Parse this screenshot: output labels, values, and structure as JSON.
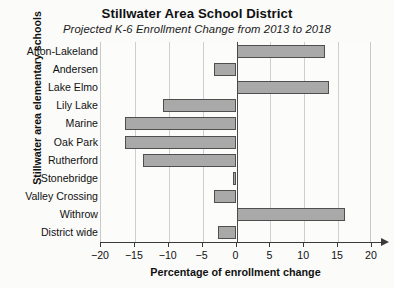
{
  "chart_data": {
    "type": "bar",
    "orientation": "horizontal",
    "title": "Stillwater Area School District",
    "subtitle": "Projected K-6 Enrollment Change from 2013 to 2018",
    "xlabel": "Percentage of enrollment change",
    "ylabel": "Stillwater area elementary schools",
    "xlim": [
      -20,
      20
    ],
    "xticks": [
      -20,
      -15,
      -10,
      -5,
      0,
      5,
      10,
      15,
      20
    ],
    "xtick_labels": [
      "−20",
      "−15",
      "−10",
      "−5",
      "0",
      "5",
      "10",
      "15",
      "20"
    ],
    "grid": true,
    "legend": "none",
    "bar_color": "#a9a9a9",
    "bar_edge_color": "#4f4f4f",
    "categories": [
      "Afton-Lakeland",
      "Andersen",
      "Lake Elmo",
      "Lily Lake",
      "Marine",
      "Oak Park",
      "Rutherford",
      "Stonebridge",
      "Valley Crossing",
      "Withrow",
      "District wide"
    ],
    "values": [
      13.0,
      -3.3,
      13.7,
      -10.8,
      -16.5,
      -16.5,
      -13.8,
      -0.5,
      -3.3,
      16.0,
      -2.7
    ]
  }
}
